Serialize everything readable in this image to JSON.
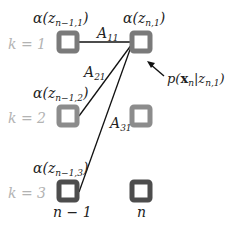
{
  "diagram": {
    "type": "forward-recursion-lattice",
    "colors": {
      "k1_box": "#7a7a7a",
      "k2_box": "#8c8c8c",
      "k3_box": "#4d4d4d",
      "line": "#111111",
      "k_label": "#b3b3b3",
      "text": "#222222"
    },
    "rows": [
      {
        "k_label": "k = 1",
        "alpha_left": "α(z",
        "alpha_left_sub": "n−1,1",
        "alpha_left_close": ")",
        "alpha_right": "α(z",
        "alpha_right_sub": "n,1",
        "alpha_right_close": ")"
      },
      {
        "k_label": "k = 2",
        "alpha_left": "α(z",
        "alpha_left_sub": "n−1,2",
        "alpha_left_close": ")"
      },
      {
        "k_label": "k = 3",
        "alpha_left": "α(z",
        "alpha_left_sub": "n−1,3",
        "alpha_left_close": ")"
      }
    ],
    "edges": [
      {
        "label": "A",
        "sub": "11"
      },
      {
        "label": "A",
        "sub": "21"
      },
      {
        "label": "A",
        "sub": "31"
      }
    ],
    "emission": {
      "text_p": "p(",
      "text_x": "x",
      "text_xsub": "n",
      "text_bar": "|z",
      "text_zsub": "n,1",
      "text_close": ")"
    },
    "columns": [
      {
        "label": "n − 1"
      },
      {
        "label": "n"
      }
    ]
  }
}
